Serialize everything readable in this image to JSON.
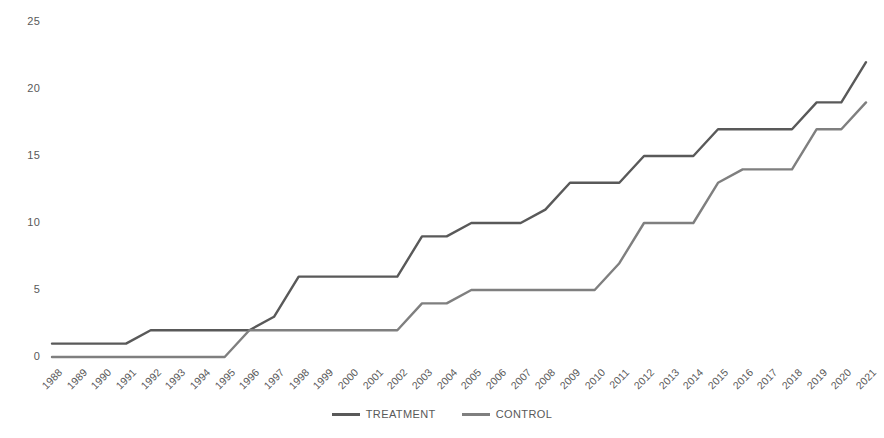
{
  "chart_data": {
    "type": "line",
    "title": "",
    "subtitle": "",
    "xlabel": "",
    "ylabel": "",
    "grid": false,
    "legend_position": "bottom",
    "ylim": [
      0,
      25
    ],
    "yticks": [
      0,
      5,
      10,
      15,
      20,
      25
    ],
    "ytick_labels": [
      "0",
      "5",
      "10",
      "15",
      "20",
      "25"
    ],
    "categories": [
      "1988",
      "1989",
      "1990",
      "1991",
      "1992",
      "1993",
      "1994",
      "1995",
      "1996",
      "1997",
      "1998",
      "1999",
      "2000",
      "2001",
      "2002",
      "2003",
      "2004",
      "2005",
      "2006",
      "2007",
      "2008",
      "2009",
      "2010",
      "2011",
      "2012",
      "2013",
      "2014",
      "2015",
      "2016",
      "2017",
      "2018",
      "2019",
      "2020",
      "2021"
    ],
    "series": [
      {
        "name": "TREATMENT",
        "color": "#595959",
        "values": [
          1,
          1,
          1,
          1,
          2,
          2,
          2,
          2,
          2,
          3,
          6,
          6,
          6,
          6,
          6,
          9,
          9,
          10,
          10,
          10,
          11,
          13,
          13,
          13,
          15,
          15,
          15,
          17,
          17,
          17,
          17,
          19,
          19,
          22
        ]
      },
      {
        "name": "CONTROL",
        "color": "#7f7f7f",
        "values": [
          0,
          0,
          0,
          0,
          0,
          0,
          0,
          0,
          2,
          2,
          2,
          2,
          2,
          2,
          2,
          4,
          4,
          5,
          5,
          5,
          5,
          5,
          5,
          7,
          10,
          10,
          10,
          13,
          14,
          14,
          14,
          17,
          17,
          19
        ]
      }
    ]
  },
  "legend": {
    "entries": [
      {
        "label": "TREATMENT",
        "color": "#595959"
      },
      {
        "label": "CONTROL",
        "color": "#7f7f7f"
      }
    ]
  }
}
